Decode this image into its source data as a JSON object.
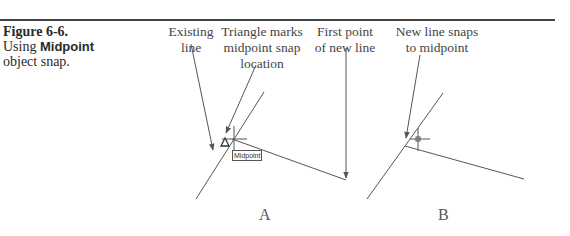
{
  "caption": {
    "figure_number": "Figure 6-6.",
    "line2_prefix": "Using ",
    "line2_bold": "Midpoint",
    "line3": "object snap."
  },
  "callouts": {
    "existing_line": [
      "Existing",
      "line"
    ],
    "triangle_marks": [
      "Triangle marks",
      "midpoint snap",
      "location"
    ],
    "first_point": [
      "First point",
      "of new line"
    ],
    "new_line_snaps": [
      "New line snaps",
      "to midpoint"
    ]
  },
  "drawing_a": {
    "tooltip": "Midpoint",
    "panel_label": "A"
  },
  "drawing_b": {
    "panel_label": "B"
  },
  "colors": {
    "line": "#555555",
    "rule": "#444444",
    "text": "#3a3a3a"
  }
}
